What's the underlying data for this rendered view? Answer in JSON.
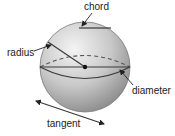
{
  "diagram": {
    "type": "sphere-parts",
    "labels": {
      "chord": "chord",
      "radius": "radius",
      "diameter": "diameter",
      "tangent": "tangent"
    },
    "colors": {
      "sphere_light": "#f2f2f2",
      "sphere_dark": "#8a8a8a",
      "line": "#3a3a3a",
      "text": "#222222"
    }
  }
}
